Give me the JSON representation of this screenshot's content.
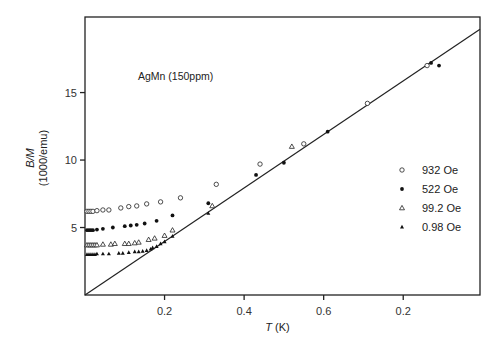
{
  "chart_data": {
    "type": "scatter",
    "title": "",
    "annotation": "AgMn (150ppm)",
    "xlabel": "T (K)",
    "xlabel_var": "T",
    "xlabel_unit": "(K)",
    "ylabel": "B/M (1000/emu)",
    "ylabel_line1": "B/M",
    "ylabel_line2": "(1000/emu)",
    "xlim": [
      0,
      0.993
    ],
    "ylim": [
      0,
      20.6
    ],
    "x_ticks": [
      {
        "value": 0.2,
        "label": "0.2"
      },
      {
        "value": 0.4,
        "label": "0.4"
      },
      {
        "value": 0.6,
        "label": "0.6"
      },
      {
        "value": 0.8,
        "label": "0.2"
      }
    ],
    "y_ticks": [
      {
        "value": 5,
        "label": "5"
      },
      {
        "value": 10,
        "label": "10"
      },
      {
        "value": 15,
        "label": "15"
      }
    ],
    "grid": false,
    "legend_position": "right-middle",
    "fit_line": {
      "name": "Curie law fit",
      "x": [
        0,
        0.993
      ],
      "y": [
        0,
        19.7
      ]
    },
    "series": [
      {
        "name": "932 Oe",
        "marker": "open-circle",
        "x": [
          0.005,
          0.01,
          0.015,
          0.02,
          0.03,
          0.045,
          0.06,
          0.09,
          0.11,
          0.13,
          0.155,
          0.19,
          0.24,
          0.33,
          0.44,
          0.55,
          0.71,
          0.86
        ],
        "y": [
          6.2,
          6.2,
          6.2,
          6.2,
          6.25,
          6.3,
          6.3,
          6.45,
          6.55,
          6.6,
          6.75,
          6.9,
          7.2,
          8.2,
          9.7,
          11.2,
          14.2,
          17.0
        ]
      },
      {
        "name": "522 Oe",
        "marker": "filled-circle",
        "x": [
          0.005,
          0.01,
          0.015,
          0.02,
          0.03,
          0.045,
          0.07,
          0.1,
          0.115,
          0.13,
          0.15,
          0.18,
          0.22,
          0.31,
          0.43,
          0.5,
          0.61,
          0.87,
          0.89
        ],
        "y": [
          4.8,
          4.8,
          4.8,
          4.8,
          4.85,
          4.9,
          5.0,
          5.1,
          5.15,
          5.2,
          5.3,
          5.5,
          5.9,
          6.8,
          8.9,
          9.8,
          12.1,
          17.2,
          17.0
        ]
      },
      {
        "name": "99.2 Oe",
        "marker": "open-triangle",
        "x": [
          0.005,
          0.01,
          0.015,
          0.02,
          0.025,
          0.03,
          0.045,
          0.065,
          0.075,
          0.1,
          0.11,
          0.125,
          0.135,
          0.16,
          0.175,
          0.2,
          0.22,
          0.32,
          0.52
        ],
        "y": [
          3.7,
          3.7,
          3.7,
          3.7,
          3.7,
          3.7,
          3.75,
          3.75,
          3.8,
          3.8,
          3.8,
          3.85,
          3.9,
          4.1,
          4.2,
          4.4,
          4.8,
          6.6,
          11.0
        ]
      },
      {
        "name": "0.98 Oe",
        "marker": "filled-triangle",
        "x": [
          0.005,
          0.01,
          0.015,
          0.02,
          0.025,
          0.03,
          0.045,
          0.06,
          0.085,
          0.095,
          0.11,
          0.125,
          0.135,
          0.145,
          0.155,
          0.165,
          0.17,
          0.18,
          0.19,
          0.2,
          0.22,
          0.31
        ],
        "y": [
          3.0,
          3.0,
          3.0,
          3.0,
          3.0,
          3.05,
          3.05,
          3.05,
          3.1,
          3.1,
          3.15,
          3.2,
          3.2,
          3.25,
          3.3,
          3.4,
          3.5,
          3.6,
          3.8,
          3.95,
          4.35,
          6.05
        ]
      }
    ]
  }
}
